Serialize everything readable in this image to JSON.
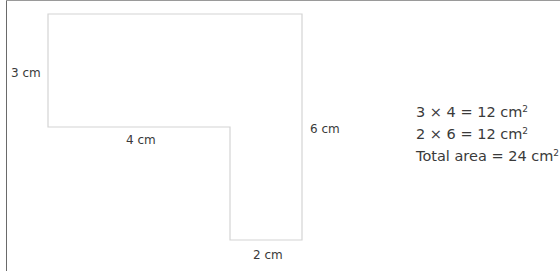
{
  "diagram": {
    "type": "compound-shape-area",
    "shape": "L-shape",
    "labels": {
      "left_height": "3 cm",
      "bottom_left_width": "4 cm",
      "right_height": "6 cm",
      "bottom_width": "2 cm"
    },
    "colors": {
      "outline": "#d4d4d4",
      "text": "#3a3a3a"
    }
  },
  "calculation": {
    "line1": {
      "expr": "3 × 4 = 12 cm",
      "exp": "2"
    },
    "line2": {
      "expr": "2 × 6 = 12 cm",
      "exp": "2"
    },
    "line3": {
      "expr": "Total area = 24 cm",
      "exp": "2"
    }
  }
}
